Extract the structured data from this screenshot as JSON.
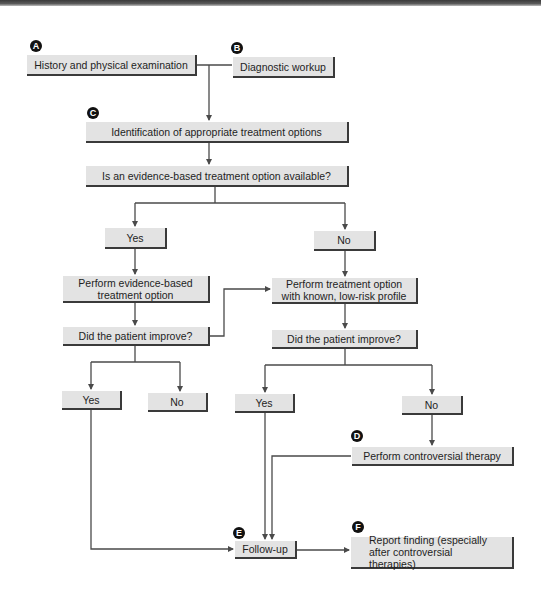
{
  "diagram": {
    "type": "flowchart",
    "colors": {
      "box_fill": "#e3e3e3",
      "box_shadow": "#3a3a3a",
      "line": "#4a4a4a",
      "badge": "#111111"
    },
    "badges": {
      "a": "A",
      "b": "B",
      "c": "C",
      "d": "D",
      "e": "E",
      "f": "F"
    },
    "nodes": {
      "history": "History and physical examination",
      "workup": "Diagnostic workup",
      "identify": "Identification of appropriate treatment options",
      "evidence_q": "Is an evidence-based treatment option available?",
      "yes1": "Yes",
      "no1": "No",
      "perform_eb": "Perform evidence-based treatment option",
      "perform_lowrisk": "Perform treatment option with known, low-risk profile",
      "improve_left": "Did the patient improve?",
      "improve_right": "Did the patient improve?",
      "yes_left": "Yes",
      "no_left": "No",
      "yes_right": "Yes",
      "no_right": "No",
      "controversial": "Perform controversial therapy",
      "followup": "Follow-up",
      "report": "Report finding (especially after controversial therapies)"
    },
    "edges": [
      [
        "history",
        "identify"
      ],
      [
        "workup",
        "identify"
      ],
      [
        "identify",
        "evidence_q"
      ],
      [
        "evidence_q",
        "yes1"
      ],
      [
        "evidence_q",
        "no1"
      ],
      [
        "yes1",
        "perform_eb"
      ],
      [
        "no1",
        "perform_lowrisk"
      ],
      [
        "perform_eb",
        "improve_left"
      ],
      [
        "improve_left",
        "perform_lowrisk"
      ],
      [
        "improve_left",
        "yes_left"
      ],
      [
        "improve_left",
        "no_left"
      ],
      [
        "perform_lowrisk",
        "improve_right"
      ],
      [
        "improve_right",
        "yes_right"
      ],
      [
        "improve_right",
        "no_right"
      ],
      [
        "no_right",
        "controversial"
      ],
      [
        "yes_left",
        "followup"
      ],
      [
        "yes_right",
        "followup"
      ],
      [
        "controversial",
        "followup"
      ],
      [
        "followup",
        "report"
      ]
    ]
  }
}
